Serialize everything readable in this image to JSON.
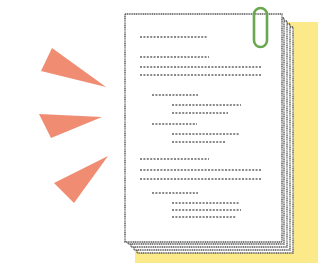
{
  "illustration": {
    "subject": "stack of documents with paperclip and attention burst",
    "colors": {
      "background": "#ffffff",
      "burst": "#f08c72",
      "highlight_panel": "#fbe98a",
      "page_fill": "#ffffff",
      "page_outline": "#555555",
      "text_dots": "#8a8a8a",
      "paperclip": "#6aa84f"
    },
    "burst_triangles": [
      {
        "points": "52,48 41,71 106,87"
      },
      {
        "points": "39,114 102,117 51,138"
      },
      {
        "points": "108,156 54,183 74,203"
      }
    ],
    "highlight_panel": {
      "x": 135,
      "y": 22,
      "w": 183,
      "h": 241
    },
    "stacked_pages": [
      {
        "points": "137,27 293,27 293,253 137,253"
      },
      {
        "points": "134,24 290,24 290,250 134,250"
      },
      {
        "points": "131,21 287,21 287,247 131,247"
      },
      {
        "points": "128,18 284,18 284,244 128,244"
      }
    ],
    "top_page": {
      "x": 125,
      "y": 14,
      "w": 157,
      "h": 228
    },
    "paperclip": {
      "x": 254,
      "y": 8,
      "w": 13,
      "h": 39
    },
    "text_lines": [
      {
        "x1": 140,
        "x2": 208,
        "y": 37
      },
      {
        "x1": 140,
        "x2": 209,
        "y": 57
      },
      {
        "x1": 140,
        "x2": 262,
        "y": 67
      },
      {
        "x1": 140,
        "x2": 262,
        "y": 75
      },
      {
        "x1": 152,
        "x2": 198,
        "y": 95
      },
      {
        "x1": 172,
        "x2": 241,
        "y": 105
      },
      {
        "x1": 172,
        "x2": 228,
        "y": 113
      },
      {
        "x1": 152,
        "x2": 197,
        "y": 124
      },
      {
        "x1": 172,
        "x2": 239,
        "y": 134
      },
      {
        "x1": 172,
        "x2": 225,
        "y": 142
      },
      {
        "x1": 140,
        "x2": 209,
        "y": 159
      },
      {
        "x1": 140,
        "x2": 262,
        "y": 170
      },
      {
        "x1": 140,
        "x2": 262,
        "y": 179
      },
      {
        "x1": 152,
        "x2": 198,
        "y": 193
      },
      {
        "x1": 172,
        "x2": 240,
        "y": 203
      },
      {
        "x1": 172,
        "x2": 241,
        "y": 210
      },
      {
        "x1": 172,
        "x2": 236,
        "y": 217
      }
    ]
  }
}
